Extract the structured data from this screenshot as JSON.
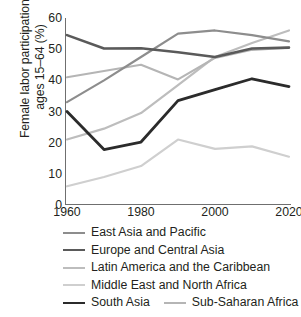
{
  "chart_data": {
    "type": "line",
    "title": "",
    "xlabel": "",
    "ylabel": "Female labor participation,\nages 15–64 (%)",
    "x": [
      1960,
      1970,
      1980,
      1990,
      2000,
      2010,
      2020
    ],
    "xlim": [
      1960,
      2020
    ],
    "ylim": [
      0,
      60
    ],
    "xticks": [
      "1960",
      "1980",
      "2000",
      "2020"
    ],
    "xtick_values": [
      1960,
      1980,
      2000,
      2020
    ],
    "yticks": [
      "0",
      "10",
      "20",
      "30",
      "40",
      "50",
      "60"
    ],
    "ytick_values": [
      0,
      10,
      20,
      30,
      40,
      50,
      60
    ],
    "grid": false,
    "legend_position": "below",
    "series": [
      {
        "name": "East Asia and Pacific",
        "color": "#8d8d8d",
        "width": 2.2,
        "values": [
          33.0,
          40.0,
          47.5,
          55.0,
          56.0,
          54.5,
          52.5
        ]
      },
      {
        "name": "Europe and Central Asia",
        "color": "#5a5a5a",
        "width": 2.6,
        "values": [
          54.5,
          50.2,
          50.3,
          49.0,
          47.5,
          50.2,
          50.5
        ]
      },
      {
        "name": "Latin America and the Caribbean",
        "color": "#bdbdbd",
        "width": 2.2,
        "values": [
          21.0,
          24.5,
          29.5,
          38.5,
          47.5,
          52.0,
          56.0
        ]
      },
      {
        "name": "Middle East and North Africa",
        "color": "#cfcfcf",
        "width": 2.2,
        "values": [
          6.0,
          9.0,
          12.5,
          21.0,
          18.0,
          18.8,
          15.5
        ]
      },
      {
        "name": "South Asia",
        "color": "#2b2b2b",
        "width": 2.8,
        "values": [
          30.0,
          17.8,
          20.2,
          33.5,
          37.0,
          40.5,
          38.0
        ]
      },
      {
        "name": "Sub-Saharan Africa",
        "color": "#b5b5b5",
        "width": 2.2,
        "values": [
          41.0,
          43.0,
          45.0,
          40.3,
          47.2,
          49.8,
          50.5
        ]
      }
    ]
  },
  "legend": {
    "rows": [
      [
        {
          "series": 0
        }
      ],
      [
        {
          "series": 1
        }
      ],
      [
        {
          "series": 2
        }
      ],
      [
        {
          "series": 3
        }
      ],
      [
        {
          "series": 4
        },
        {
          "series": 5
        }
      ]
    ]
  }
}
